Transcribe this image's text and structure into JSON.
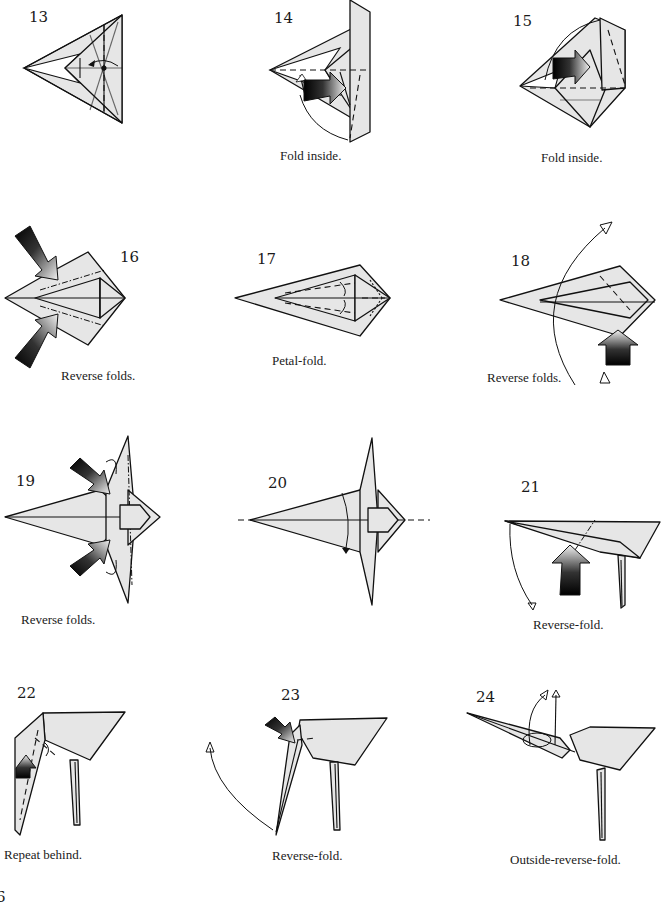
{
  "colors": {
    "paper": "#e6e6e6",
    "line": "#111111",
    "background": "#ffffff",
    "arrow_dark": "#111111"
  },
  "steps": [
    {
      "number": "13",
      "caption": ""
    },
    {
      "number": "14",
      "caption": "Fold inside."
    },
    {
      "number": "15",
      "caption": "Fold inside."
    },
    {
      "number": "16",
      "caption": "Reverse folds."
    },
    {
      "number": "17",
      "caption": "Petal-fold."
    },
    {
      "number": "18",
      "caption": "Reverse folds."
    },
    {
      "number": "19",
      "caption": "Reverse folds."
    },
    {
      "number": "20",
      "caption": ""
    },
    {
      "number": "21",
      "caption": "Reverse-fold."
    },
    {
      "number": "22",
      "caption": "Repeat behind."
    },
    {
      "number": "23",
      "caption": "Reverse-fold."
    },
    {
      "number": "24",
      "caption": "Outside-reverse-fold."
    }
  ],
  "page": {
    "number": "6"
  }
}
